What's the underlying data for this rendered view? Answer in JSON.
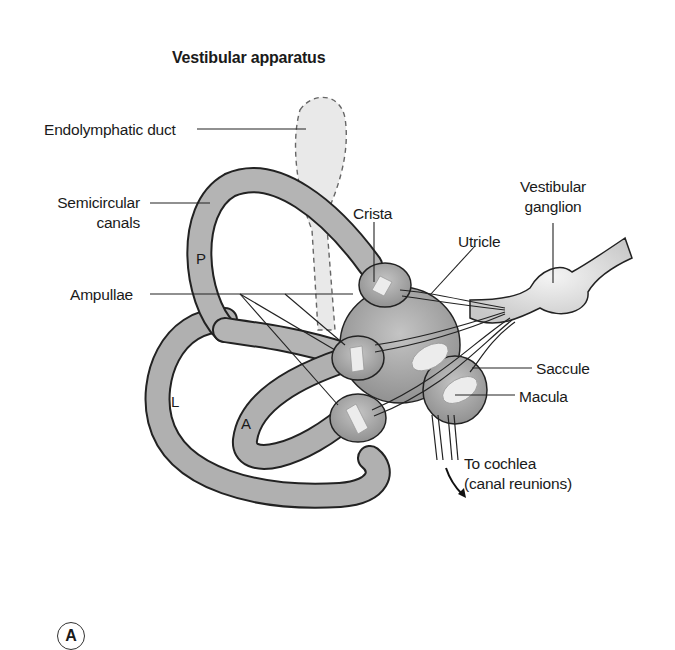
{
  "figure": {
    "title": "Vestibular apparatus",
    "panel_label": "A"
  },
  "labels": {
    "endolymphatic_duct": "Endolymphatic duct",
    "semicircular_canals_line1": "Semicircular",
    "semicircular_canals_line2": "canals",
    "ampullae": "Ampullae",
    "crista": "Crista",
    "utricle": "Utricle",
    "vestibular_ganglion_line1": "Vestibular",
    "vestibular_ganglion_line2": "ganglion",
    "saccule": "Saccule",
    "macula": "Macula",
    "to_cochlea_line1": "To cochlea",
    "to_cochlea_line2": "(canal reunions)"
  },
  "canal_letters": {
    "posterior": "P",
    "lateral": "L",
    "anterior": "A"
  },
  "colors": {
    "tissue_fill": "#a8a8a8",
    "tissue_dark": "#8a8a8a",
    "outline": "#222222",
    "duct_fill": "#e6e6e6",
    "sensory_patch": "#ececec",
    "ganglion_fill": "#dcdcdc"
  }
}
